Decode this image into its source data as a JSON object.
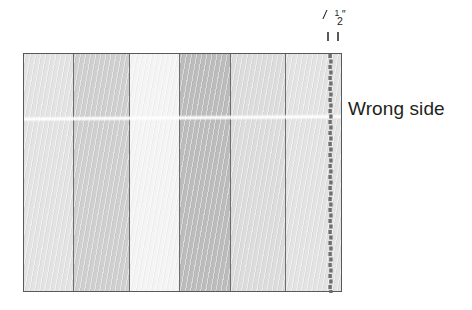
{
  "figure": {
    "name": "pieced-fabric-seam-allowance-diagram"
  },
  "fabric": {
    "strips": [
      {
        "id": "strip-1",
        "shade_label": "light gray",
        "color": "#e3e3e3",
        "width_pct": 15.8
      },
      {
        "id": "strip-2",
        "shade_label": "medium gray",
        "color": "#cfcfcf",
        "width_pct": 17.6
      },
      {
        "id": "strip-3",
        "shade_label": "near white",
        "color": "#f4f4f4",
        "width_pct": 15.8
      },
      {
        "id": "strip-4",
        "shade_label": "dark gray",
        "color": "#bcbcbc",
        "width_pct": 16.1
      },
      {
        "id": "strip-5",
        "shade_label": "medium light gray",
        "color": "#dcdcdc",
        "width_pct": 17.3
      },
      {
        "id": "strip-6",
        "shade_label": "light gray",
        "color": "#e3e3e3",
        "width_pct": 17.4
      }
    ],
    "outline_color": "#58595b",
    "seam_line_color": "#6d6e71"
  },
  "measurement": {
    "numerator": "1",
    "denominator": "2",
    "inch_symbol": "″",
    "full_label": "½″",
    "tick_count": 2,
    "meaning": "seam allowance width"
  },
  "annotations": {
    "wrong_side_label": "Wrong side"
  },
  "colors": {
    "background": "#ffffff",
    "ink": "#231f20",
    "outline": "#58595b",
    "stitch": "#6d6e71"
  }
}
